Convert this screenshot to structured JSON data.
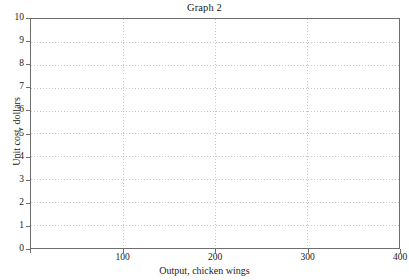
{
  "chart_data": {
    "type": "line",
    "title": "Graph 2",
    "xlabel": "Output, chicken wings",
    "ylabel": "Unit cost, dollars",
    "xlim": [
      0,
      400
    ],
    "ylim": [
      0,
      10
    ],
    "x_ticks": [
      0,
      100,
      200,
      300,
      400
    ],
    "x_tick_labels": [
      "",
      "100",
      "200",
      "300",
      "400"
    ],
    "y_ticks": [
      0,
      1,
      2,
      3,
      4,
      5,
      6,
      7,
      8,
      9,
      10
    ],
    "y_tick_labels": [
      "0",
      "1",
      "2",
      "3",
      "4",
      "5",
      "6",
      "7",
      "8",
      "9",
      "10"
    ],
    "grid": true,
    "grid_style": "dotted",
    "legend": false,
    "series": [],
    "values": [],
    "categories": [],
    "annotations": [],
    "note": "Empty plotting grid with no data series drawn"
  },
  "style": {
    "background": "#ffffff",
    "axis_color": "#6e6e6e",
    "grid_color": "#b9b9b9",
    "text_color": "#1a1a1a"
  }
}
